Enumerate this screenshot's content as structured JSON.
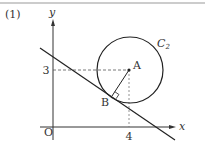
{
  "problem": {
    "number_label": "(1)"
  },
  "axes": {
    "x_label": "x",
    "y_label": "y",
    "origin_label": "O",
    "x_tick_label": "4",
    "y_tick_label": "3"
  },
  "circle": {
    "name": "C",
    "subscript": "2",
    "center_label": "A"
  },
  "points": {
    "tangent_point_label": "B"
  },
  "colors": {
    "stroke": "#222222",
    "dashed": "#555555",
    "border": "#999999"
  }
}
